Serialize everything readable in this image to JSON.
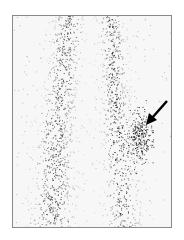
{
  "image": {
    "description": "Grayscale nuclear scintigraphy of two lower legs (anterior view) with an arrow pointing to focal uptake on the right-side limb",
    "background_color": "#ffffff",
    "frame_color": "#8a8a8a",
    "field_color": "#f7f7f7",
    "dot_color": "#1a1a1a",
    "arrow": {
      "color": "#000000",
      "from": [
        167,
        101
      ],
      "to": [
        148,
        123
      ]
    }
  }
}
